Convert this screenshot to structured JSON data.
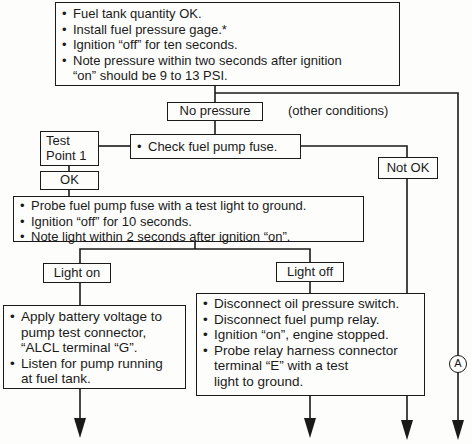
{
  "flowchart": {
    "start_box": {
      "items": [
        "Fuel tank quantity OK.",
        "Install fuel pressure gage.*",
        "Ignition “off” for ten seconds.",
        "Note pressure within two seconds after ignition",
        "“on” should be 9 to 13 PSI."
      ]
    },
    "no_pressure_label": "No pressure",
    "other_conditions_label": "(other conditions)",
    "test_point_label": "Test Point 1",
    "test_point_line1": "Test",
    "test_point_line2": "Point 1",
    "check_fuse_box": {
      "items": [
        "Check fuel pump fuse."
      ]
    },
    "not_ok_label": "Not OK",
    "ok_label": "OK",
    "probe_box": {
      "items": [
        "Probe fuel pump fuse with a test light to ground.",
        "Ignition “off” for 10 seconds.",
        "Note light within 2 seconds after ignition “on”."
      ]
    },
    "light_on_label": "Light on",
    "light_off_label": "Light off",
    "light_on_box": {
      "items": [
        {
          "line1": "Apply battery voltage to",
          "line2": "pump test connector,",
          "line3": "“ALCL terminal “G”."
        },
        {
          "line1": "Listen for pump running",
          "line2": "at fuel tank."
        }
      ]
    },
    "light_off_box": {
      "items": [
        "Disconnect oil pressure switch.",
        "Disconnect fuel pump relay.",
        "Ignition “on”, engine stopped.",
        {
          "line1": "Probe relay harness connector",
          "line2": "terminal “E” with a test",
          "line3": "light to ground."
        }
      ]
    },
    "connector_label": "A"
  }
}
